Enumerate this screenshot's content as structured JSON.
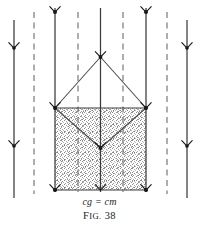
{
  "figure": {
    "caption_formula": "cg = cm",
    "figure_label_prefix": "F",
    "figure_label_smallcaps": "IG.",
    "figure_label_number": "38",
    "figure_label_full": "FIG. 38",
    "colors": {
      "line": "#3a3a3a",
      "dash": "#6e6e6e",
      "fill_stipple": "#9a9a9a",
      "marker": "#111111",
      "text": "#1c1c1c",
      "background": "#ffffff"
    },
    "layout": {
      "width": 199,
      "height": 229,
      "square": {
        "left": 55,
        "right": 146,
        "top": 108,
        "bottom": 190
      },
      "apex": {
        "x": 100.5,
        "y": 57
      },
      "center_point": {
        "x": 100.5,
        "y": 148
      }
    },
    "field_lines": [
      {
        "name": "solid-line-1",
        "x": 14,
        "style": "solid",
        "top": 20,
        "bottom": 198
      },
      {
        "name": "dashed-line-1",
        "x": 34,
        "style": "dashed",
        "top": 12,
        "bottom": 194
      },
      {
        "name": "solid-line-2",
        "x": 55,
        "style": "solid",
        "top": 8,
        "bottom": 192
      },
      {
        "name": "dashed-line-2",
        "x": 78,
        "style": "dashed",
        "top": 12,
        "bottom": 192
      },
      {
        "name": "solid-line-3",
        "x": 100.5,
        "style": "solid",
        "top": 8,
        "bottom": 192
      },
      {
        "name": "dashed-line-3",
        "x": 123,
        "style": "dashed",
        "top": 12,
        "bottom": 192
      },
      {
        "name": "solid-line-4",
        "x": 146,
        "style": "solid",
        "top": 8,
        "bottom": 192
      },
      {
        "name": "dashed-line-4",
        "x": 167,
        "style": "dashed",
        "top": 12,
        "bottom": 194
      },
      {
        "name": "solid-line-5",
        "x": 187,
        "style": "solid",
        "top": 20,
        "bottom": 198
      }
    ],
    "arrow_markers": [
      {
        "name": "arrowhead-left-upper",
        "x": 14,
        "y": 48
      },
      {
        "name": "arrowhead-left-lower",
        "x": 14,
        "y": 146
      },
      {
        "name": "arrowhead-inner-left-top",
        "x": 55,
        "y": 12
      },
      {
        "name": "arrowhead-inner-left-mid",
        "x": 55,
        "y": 108
      },
      {
        "name": "arrowhead-inner-left-bottom",
        "x": 55,
        "y": 190
      },
      {
        "name": "arrowhead-center-apex",
        "x": 100.5,
        "y": 57
      },
      {
        "name": "arrowhead-center-mid",
        "x": 100.5,
        "y": 148
      },
      {
        "name": "arrowhead-center-bottom",
        "x": 100.5,
        "y": 190
      },
      {
        "name": "arrowhead-inner-right-top",
        "x": 146,
        "y": 12
      },
      {
        "name": "arrowhead-inner-right-mid",
        "x": 146,
        "y": 108
      },
      {
        "name": "arrowhead-inner-right-bottom",
        "x": 146,
        "y": 190
      },
      {
        "name": "arrowhead-right-upper",
        "x": 187,
        "y": 48
      },
      {
        "name": "arrowhead-right-lower",
        "x": 187,
        "y": 146
      }
    ],
    "node_points": [
      {
        "name": "node-apex",
        "x": 100.5,
        "y": 57
      },
      {
        "name": "node-top-left",
        "x": 55,
        "y": 108
      },
      {
        "name": "node-top-right",
        "x": 146,
        "y": 108
      },
      {
        "name": "node-center",
        "x": 100.5,
        "y": 148
      },
      {
        "name": "node-bottom-left",
        "x": 55,
        "y": 190
      },
      {
        "name": "node-bottom-right",
        "x": 146,
        "y": 190
      },
      {
        "name": "node-top-tick-left",
        "x": 55,
        "y": 12
      },
      {
        "name": "node-top-tick-right",
        "x": 146,
        "y": 12
      }
    ],
    "connector_edges": [
      {
        "name": "edge-apex-to-top-left",
        "x1": 100.5,
        "y1": 57,
        "x2": 55,
        "y2": 108
      },
      {
        "name": "edge-apex-to-top-right",
        "x1": 100.5,
        "y1": 57,
        "x2": 146,
        "y2": 108
      },
      {
        "name": "edge-top-left-to-center",
        "x1": 55,
        "y1": 108,
        "x2": 100.5,
        "y2": 148
      },
      {
        "name": "edge-top-right-to-center",
        "x1": 146,
        "y1": 108,
        "x2": 100.5,
        "y2": 148
      }
    ]
  }
}
